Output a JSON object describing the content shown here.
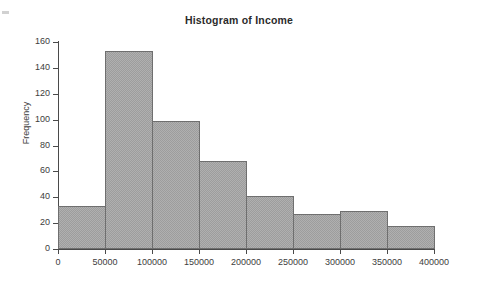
{
  "chart_data": {
    "type": "bar",
    "title": "Histogram of Income",
    "xlabel": "",
    "ylabel": "Frequency",
    "bin_width": 50000,
    "bin_edges": [
      0,
      50000,
      100000,
      150000,
      200000,
      250000,
      300000,
      350000,
      400000
    ],
    "categories": [
      "0-50000",
      "50000-100000",
      "100000-150000",
      "150000-200000",
      "200000-250000",
      "250000-300000",
      "300000-350000",
      "350000-400000"
    ],
    "values": [
      33,
      153,
      99,
      68,
      41,
      27,
      29,
      18
    ],
    "xticks": [
      "0",
      "50000",
      "100000",
      "150000",
      "200000",
      "250000",
      "300000",
      "350000",
      "400000"
    ],
    "xtick_values": [
      0,
      50000,
      100000,
      150000,
      200000,
      250000,
      300000,
      350000,
      400000
    ],
    "yticks": [
      "0",
      "20",
      "40",
      "60",
      "80",
      "100",
      "120",
      "140",
      "160"
    ],
    "ytick_values": [
      0,
      20,
      40,
      60,
      80,
      100,
      120,
      140,
      160
    ],
    "xlim": [
      0,
      400000
    ],
    "ylim": [
      0,
      160
    ],
    "grid": false,
    "legend": null,
    "bar_fill_color": "#b0b0b0",
    "bar_edge_color": "#6f6f6f",
    "axis_color": "#4a4a4a",
    "text_color": "#3d3d3d",
    "background_color": "#ffffff"
  }
}
